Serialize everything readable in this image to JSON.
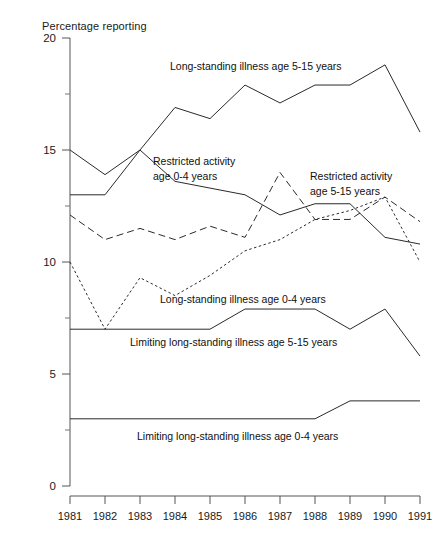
{
  "chart_data": {
    "type": "line",
    "title": "",
    "ylabel": "Percentage reporting",
    "xlabel": "",
    "ylim": [
      0,
      20
    ],
    "yticks": [
      "0",
      "5",
      "10",
      "15",
      "20"
    ],
    "ytick_minor_step": 2.5,
    "grid": false,
    "legend": "inline-annotations",
    "x": [
      1981,
      1982,
      1983,
      1984,
      1985,
      1986,
      1987,
      1988,
      1989,
      1990,
      1991
    ],
    "categories": [
      "1981",
      "1982",
      "1983",
      "1984",
      "1985",
      "1986",
      "1987",
      "1988",
      "1989",
      "1990",
      "1991"
    ],
    "series": [
      {
        "name": "Long-standing illness age 5-15 years",
        "style": "solid",
        "values": [
          13.0,
          13.0,
          15.0,
          16.9,
          16.4,
          17.9,
          17.1,
          17.9,
          17.9,
          18.8,
          15.8
        ]
      },
      {
        "name": "Restricted activity age 0-4 years",
        "style": "solid",
        "values": [
          15.0,
          13.9,
          15.0,
          13.6,
          13.3,
          13.0,
          12.1,
          12.6,
          12.6,
          11.1,
          10.8
        ]
      },
      {
        "name": "Restricted activity age 5-15 years",
        "style": "dashed",
        "values": [
          12.1,
          11.0,
          11.5,
          11.0,
          11.6,
          11.1,
          14.0,
          11.9,
          11.9,
          12.9,
          11.8
        ]
      },
      {
        "name": "Long-standing illness age 0-4 years",
        "style": "dotted",
        "values": [
          10.0,
          7.0,
          9.3,
          8.5,
          9.4,
          10.5,
          11.0,
          11.9,
          12.3,
          12.9,
          10.0
        ]
      },
      {
        "name": "Limiting long-standing illness age 5-15 years",
        "style": "solid-thin",
        "values": [
          7.0,
          7.0,
          7.0,
          7.0,
          7.0,
          7.9,
          7.9,
          7.9,
          7.0,
          7.9,
          5.8
        ]
      },
      {
        "name": "Limiting long-standing illness age 0-4 years",
        "style": "solid-thin",
        "values": [
          3.0,
          3.0,
          3.0,
          3.0,
          3.0,
          3.0,
          3.0,
          3.0,
          3.8,
          3.8,
          3.8
        ]
      }
    ],
    "annotations": [
      {
        "id": "ann-lsi-515",
        "text": "Long-standing illness age 5-15 years",
        "x": 170,
        "y": 70
      },
      {
        "id": "ann-ra-04-l1",
        "text": "Restricted activity",
        "x": 153,
        "y": 165
      },
      {
        "id": "ann-ra-04-l2",
        "text": "age 0-4 years",
        "x": 153,
        "y": 180
      },
      {
        "id": "ann-ra-515-l1",
        "text": "Restricted activity",
        "x": 310,
        "y": 180
      },
      {
        "id": "ann-ra-515-l2",
        "text": "age 5-15 years",
        "x": 310,
        "y": 195
      },
      {
        "id": "ann-lsi-04",
        "text": "Long-standing illness age 0-4 years",
        "x": 160,
        "y": 303
      },
      {
        "id": "ann-llsi-515",
        "text": "Limiting long-standing illness age 5-15 years",
        "x": 130,
        "y": 346
      },
      {
        "id": "ann-llsi-04",
        "text": "Limiting long-standing illness age 0-4 years",
        "x": 137,
        "y": 440
      }
    ]
  }
}
